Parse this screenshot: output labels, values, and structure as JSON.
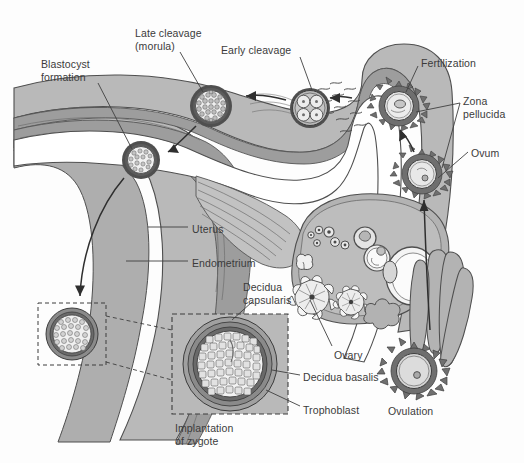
{
  "figure": {
    "title": "",
    "type": "anatomical-diagram",
    "background_color": "#fdfdfd",
    "ink_color": "#3b3b3b",
    "palette": {
      "myometrium": "#b9b9b9",
      "endometrium": "#9d9d9d",
      "lumen": "#ffffff",
      "ovary_stroma": "#b3b3b3",
      "ovary_light": "#d8d8d8",
      "zona_pellucida": "#6f6f6f",
      "cell_fill": "#ececec",
      "outline": "#4a4a4a",
      "decidua_basalis": "#8a8a8a",
      "trophoblast": "#6a6a6a"
    }
  },
  "labels": [
    {
      "id": "blastocyst-formation",
      "text": "Blastocyst\nformation",
      "x": 41,
      "y": 58,
      "align": "left"
    },
    {
      "id": "late-cleavage-morula",
      "text": "Late cleavage\n(morula)",
      "x": 135,
      "y": 27,
      "align": "left"
    },
    {
      "id": "early-cleavage",
      "text": "Early cleavage",
      "x": 221,
      "y": 44,
      "align": "left"
    },
    {
      "id": "fertilization",
      "text": "Fertilization",
      "x": 421,
      "y": 57,
      "align": "left"
    },
    {
      "id": "zona-pellucida",
      "text": "Zona\npellucida",
      "x": 463,
      "y": 95,
      "align": "left"
    },
    {
      "id": "ovum",
      "text": "Ovum",
      "x": 471,
      "y": 147,
      "align": "left"
    },
    {
      "id": "uterus",
      "text": "Uterus",
      "x": 192,
      "y": 223,
      "align": "left"
    },
    {
      "id": "endometrium",
      "text": "Endometrium",
      "x": 192,
      "y": 257,
      "align": "left"
    },
    {
      "id": "decidua-capsularis",
      "text": "Decidua\ncapsularis",
      "x": 243,
      "y": 281,
      "align": "left"
    },
    {
      "id": "ovary",
      "text": "Ovary",
      "x": 334,
      "y": 349,
      "align": "left"
    },
    {
      "id": "decidua-basalis",
      "text": "Decidua basalis",
      "x": 303,
      "y": 371,
      "align": "left"
    },
    {
      "id": "trophoblast",
      "text": "Trophoblast",
      "x": 303,
      "y": 404,
      "align": "left"
    },
    {
      "id": "implantation-of-zygote",
      "text": "Implantation\nof zygote",
      "x": 175,
      "y": 422,
      "align": "left"
    },
    {
      "id": "ovulation",
      "text": "Ovulation",
      "x": 388,
      "y": 405,
      "align": "left"
    }
  ],
  "structures": [
    {
      "id": "uterine-wall",
      "name": "Uterus (myometrium)"
    },
    {
      "id": "endometrial-lining",
      "name": "Endometrium"
    },
    {
      "id": "fallopian-tube",
      "name": "Fallopian tube / oviduct"
    },
    {
      "id": "fimbriae",
      "name": "Fimbriae"
    },
    {
      "id": "ovary",
      "name": "Ovary with developing follicles"
    },
    {
      "id": "corpus-luteum",
      "name": "Corpus luteum"
    },
    {
      "id": "cervix",
      "name": "Cervical canal"
    }
  ],
  "stages": [
    {
      "id": "ovulation",
      "order": 1,
      "label": "Ovulation"
    },
    {
      "id": "ovum",
      "order": 2,
      "label": "Ovum"
    },
    {
      "id": "fertilization",
      "order": 3,
      "label": "Fertilization"
    },
    {
      "id": "early-cleavage",
      "order": 4,
      "label": "Early cleavage",
      "cells": 4
    },
    {
      "id": "late-cleavage",
      "order": 5,
      "label": "Late cleavage (morula)"
    },
    {
      "id": "blastocyst",
      "order": 6,
      "label": "Blastocyst formation"
    },
    {
      "id": "implantation",
      "order": 7,
      "label": "Implantation of zygote"
    }
  ],
  "inset": {
    "id": "implantation-inset",
    "caption": "Implantation\nof zygote",
    "callouts": [
      "Decidua capsularis",
      "Decidua basalis",
      "Trophoblast"
    ]
  }
}
